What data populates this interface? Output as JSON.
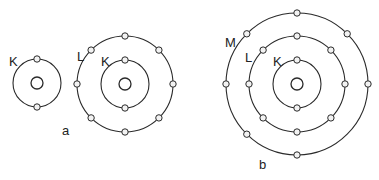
{
  "diagram": {
    "colors": {
      "stroke": "#2a2a2a",
      "electron_fill": "#f2f2f2",
      "background": "#ffffff"
    },
    "atoms": [
      {
        "id": "atom-he",
        "group": "a",
        "cx": 37,
        "cy": 83,
        "nucleus_r": 6,
        "shells": [
          {
            "name": "K",
            "r": 24,
            "electrons": 2,
            "angles": [
              -90,
              90
            ],
            "label": {
              "text": "K",
              "x": 9,
              "y": 66
            }
          }
        ]
      },
      {
        "id": "atom-ne",
        "group": "a",
        "cx": 125,
        "cy": 84,
        "nucleus_r": 6,
        "shells": [
          {
            "name": "K",
            "r": 24,
            "electrons": 2,
            "angles": [
              -90,
              90
            ],
            "label": {
              "text": "K",
              "x": 101,
              "y": 66
            }
          },
          {
            "name": "L",
            "r": 48,
            "electrons": 8,
            "angles": [
              -90,
              -45,
              0,
              45,
              90,
              135,
              180,
              225
            ],
            "label": {
              "text": "L",
              "x": 77,
              "y": 61
            }
          }
        ]
      },
      {
        "id": "atom-cl",
        "group": "b",
        "cx": 297,
        "cy": 84,
        "nucleus_r": 6,
        "shells": [
          {
            "name": "K",
            "r": 24,
            "electrons": 2,
            "angles": [
              -90,
              90
            ],
            "label": {
              "text": "K",
              "x": 273,
              "y": 66
            }
          },
          {
            "name": "L",
            "r": 48,
            "electrons": 8,
            "angles": [
              -90,
              -45,
              0,
              45,
              90,
              135,
              180,
              225
            ],
            "label": {
              "text": "L",
              "x": 245,
              "y": 62
            }
          },
          {
            "name": "M",
            "r": 71,
            "electrons": 7,
            "angles": [
              -90,
              -45,
              0,
              90,
              135,
              180,
              225
            ],
            "label": {
              "text": "M",
              "x": 225,
              "y": 47
            }
          }
        ]
      }
    ],
    "captions": [
      {
        "text": "a",
        "x": 62,
        "y": 135
      },
      {
        "text": "b",
        "x": 259,
        "y": 169
      }
    ]
  }
}
